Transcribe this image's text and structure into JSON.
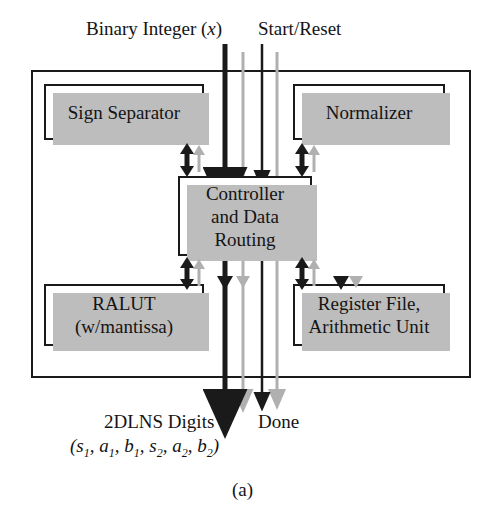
{
  "figure": {
    "caption": "(a)",
    "inputs": {
      "binary_integer": "Binary Integer (",
      "binary_integer_var": "x",
      "binary_integer_close": ")",
      "start_reset": "Start/Reset"
    },
    "outputs": {
      "digits_label": "2DLNS Digits",
      "digits_tuple": "(s1, a1, b1, s2, a2, b2)",
      "done_label": "Done"
    },
    "blocks": [
      {
        "id": "sign-separator",
        "label": "Sign Separator"
      },
      {
        "id": "normalizer",
        "label": "Normalizer"
      },
      {
        "id": "controller",
        "line1": "Controller",
        "line2": "and Data",
        "line3": "Routing"
      },
      {
        "id": "ralut",
        "line1": "RALUT",
        "line2": "(w/mantissa)"
      },
      {
        "id": "register-file",
        "line1": "Register File,",
        "line2": "Arithmetic Unit"
      }
    ],
    "colors": {
      "line_black": "#1a1a1a",
      "line_gray": "#b0b0b0",
      "shadow_gray": "#bdbdbd",
      "background": "#ffffff"
    },
    "wires": {
      "data_bus_x": 225,
      "data_bus_gray_x": 243,
      "control_x": 262,
      "control_gray_x": 277
    }
  }
}
